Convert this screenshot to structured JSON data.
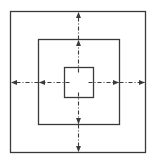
{
  "diagram": {
    "colors": {
      "stroke": "#3a3a3a",
      "background": "#ffffff"
    },
    "squares": [
      {
        "name": "outer-square",
        "x": 10,
        "y": 11,
        "w": 135,
        "h": 141
      },
      {
        "name": "middle-square",
        "x": 38,
        "y": 39,
        "w": 81,
        "h": 85
      },
      {
        "name": "inner-square",
        "x": 64,
        "y": 67,
        "w": 29,
        "h": 30
      }
    ],
    "center": {
      "x": 78,
      "y": 82
    },
    "arrows": [
      {
        "name": "arrow-up-inner",
        "x1": 78,
        "y1": 72,
        "x2": 78,
        "y2": 40
      },
      {
        "name": "arrow-up-outer",
        "x1": 78,
        "y1": 39,
        "x2": 78,
        "y2": 12
      },
      {
        "name": "arrow-down-inner",
        "x1": 78,
        "y1": 92,
        "x2": 78,
        "y2": 123
      },
      {
        "name": "arrow-down-outer",
        "x1": 78,
        "y1": 124,
        "x2": 78,
        "y2": 151
      },
      {
        "name": "arrow-left-inner",
        "x1": 69,
        "y1": 82,
        "x2": 39,
        "y2": 82
      },
      {
        "name": "arrow-left-outer",
        "x1": 38,
        "y1": 82,
        "x2": 11,
        "y2": 82
      },
      {
        "name": "arrow-right-inner",
        "x1": 88,
        "y1": 82,
        "x2": 118,
        "y2": 82
      },
      {
        "name": "arrow-right-outer",
        "x1": 119,
        "y1": 82,
        "x2": 144,
        "y2": 82
      }
    ]
  }
}
